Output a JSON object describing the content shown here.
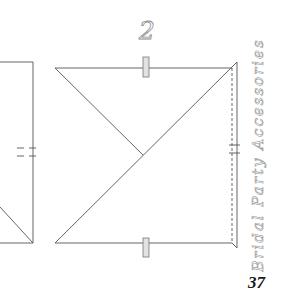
{
  "page": {
    "step_number": "2",
    "side_title": "Bridal Party Accessories",
    "page_number": "37"
  },
  "diagram": {
    "line_color": "#555555",
    "tab_fill": "#e2e2e2",
    "tab_stroke": "#777777"
  }
}
